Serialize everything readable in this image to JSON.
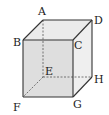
{
  "diagram": {
    "type": "cube",
    "colors": {
      "edge": "#333333",
      "hidden_edge": "#555555",
      "front_face": "#dedede",
      "top_face": "#ebebeb",
      "right_face": "#efefef",
      "label": "#222222"
    },
    "vertices": {
      "A": {
        "label": "A",
        "x": 43,
        "y": 20
      },
      "B": {
        "label": "B",
        "x": 23,
        "y": 40
      },
      "C": {
        "label": "C",
        "x": 73,
        "y": 40
      },
      "D": {
        "label": "D",
        "x": 92,
        "y": 20
      },
      "E": {
        "label": "E",
        "x": 43,
        "y": 77
      },
      "F": {
        "label": "F",
        "x": 23,
        "y": 97
      },
      "G": {
        "label": "G",
        "x": 73,
        "y": 97
      },
      "H": {
        "label": "H",
        "x": 92,
        "y": 77
      }
    },
    "visible_edges": [
      "AB",
      "AD",
      "BC",
      "CD",
      "BF",
      "CG",
      "DH",
      "FG",
      "GH"
    ],
    "hidden_edges": [
      "AE",
      "EF",
      "EH"
    ]
  }
}
